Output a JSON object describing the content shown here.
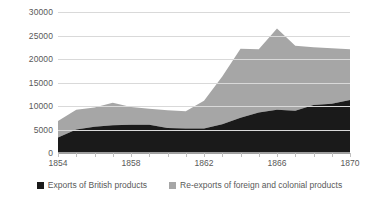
{
  "chart_data": {
    "type": "area",
    "stacked": true,
    "title": "",
    "xlabel": "",
    "ylabel": "",
    "x": [
      1854,
      1855,
      1856,
      1857,
      1858,
      1859,
      1860,
      1861,
      1862,
      1863,
      1864,
      1865,
      1866,
      1867,
      1868,
      1869,
      1870
    ],
    "tick_labels": [
      "1854",
      "1858",
      "1862",
      "1866",
      "1870"
    ],
    "tick_years": [
      1854,
      1858,
      1862,
      1866,
      1870
    ],
    "ylim": [
      0,
      30000
    ],
    "yticks": [
      0,
      5000,
      10000,
      15000,
      20000,
      25000,
      30000
    ],
    "ytick_labels": [
      "0",
      "5000",
      "10000",
      "15000",
      "20000",
      "25000",
      "30000"
    ],
    "xlim": [
      1854,
      1870
    ],
    "grid": true,
    "legend_position": "bottom",
    "series": [
      {
        "name": "Exports of British products",
        "color": "#1a1a1a",
        "values": [
          3300,
          5000,
          5600,
          5900,
          6000,
          6000,
          5300,
          5200,
          5200,
          6100,
          7500,
          8600,
          9200,
          9000,
          10200,
          10500,
          11300
        ]
      },
      {
        "name": "Re-exports of foreign and colonial products",
        "color": "#a6a6a6",
        "values": [
          3500,
          4200,
          4100,
          4800,
          3800,
          3400,
          3800,
          3700,
          5900,
          10200,
          14700,
          13500,
          17300,
          13800,
          12300,
          11800,
          10800
        ]
      }
    ],
    "totals": [
      6800,
      9200,
      9700,
      10700,
      9800,
      9400,
      9100,
      8900,
      11100,
      16300,
      22200,
      22100,
      26500,
      22800,
      22500,
      22300,
      22100
    ]
  },
  "legend": {
    "items": [
      {
        "label": "Exports of British products",
        "color": "#1a1a1a"
      },
      {
        "label": "Re-exports of foreign and colonial products",
        "color": "#a6a6a6"
      }
    ]
  }
}
